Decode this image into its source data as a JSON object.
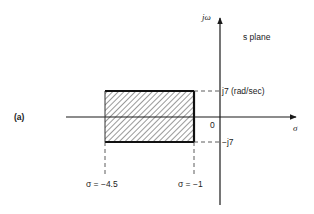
{
  "figure": {
    "panel_label": "(a)",
    "plane_label": "s plane",
    "axes": {
      "vertical_label": "jω",
      "horizontal_label": "σ",
      "origin_label": "0"
    },
    "region": {
      "sigma_min": -4.5,
      "sigma_max": -1,
      "omega_min": -7,
      "omega_max": 7,
      "fill": "hatched"
    },
    "annotations": {
      "upper_omega": "j7 (rad/sec)",
      "lower_omega": "−j7",
      "left_sigma": "σ = −4.5",
      "right_sigma": "σ = −1"
    }
  },
  "colors": {
    "line": "#1a1a1a",
    "hatch": "#444444",
    "background": "#ffffff"
  }
}
